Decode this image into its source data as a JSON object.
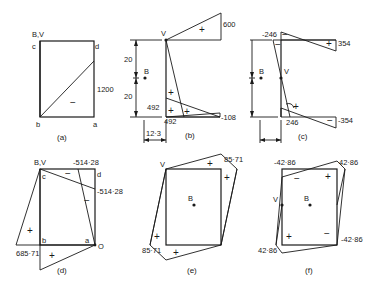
{
  "figure": {
    "panels": [
      {
        "id": "a",
        "caption": "(a)",
        "labels": {
          "origin": "B,V",
          "c": "c",
          "d": "d",
          "b": "b",
          "a": "a"
        },
        "values": [
          "1200"
        ],
        "signs": [
          "−"
        ]
      },
      {
        "id": "b",
        "caption": "(b)",
        "labels": {
          "v": "V",
          "b": "B"
        },
        "values": [
          "600",
          "492",
          "492",
          "-108"
        ],
        "dimensions": [
          "20",
          "20",
          "12·3"
        ],
        "signs": [
          "+",
          "+",
          "+",
          "+"
        ]
      },
      {
        "id": "c",
        "caption": "(c)",
        "labels": {
          "v": "V",
          "b": "B"
        },
        "values": [
          "-246",
          "354",
          "246",
          "-354"
        ],
        "dimensions": [
          "20",
          "20",
          "12·3"
        ],
        "signs": [
          "−",
          "+",
          "−",
          "+",
          "−"
        ]
      },
      {
        "id": "d",
        "caption": "(d)",
        "labels": {
          "origin": "B,V",
          "c": "c",
          "d": "d",
          "b": "b",
          "a": "a",
          "o": "O"
        },
        "values": [
          "-514·28",
          "-514·28",
          "685·71"
        ],
        "signs": [
          "−",
          "−",
          "+",
          "+"
        ]
      },
      {
        "id": "e",
        "caption": "(e)",
        "labels": {
          "v": "V",
          "b": "B"
        },
        "values": [
          "85·71",
          "85·71"
        ],
        "signs": [
          "+",
          "+",
          "+",
          "+"
        ]
      },
      {
        "id": "f",
        "caption": "(f)",
        "labels": {
          "v": "V",
          "b": "B"
        },
        "values": [
          "-42·86",
          "42·86",
          "-42·86",
          "42·86"
        ],
        "signs": [
          "−",
          "+",
          "+",
          "−"
        ]
      }
    ]
  }
}
